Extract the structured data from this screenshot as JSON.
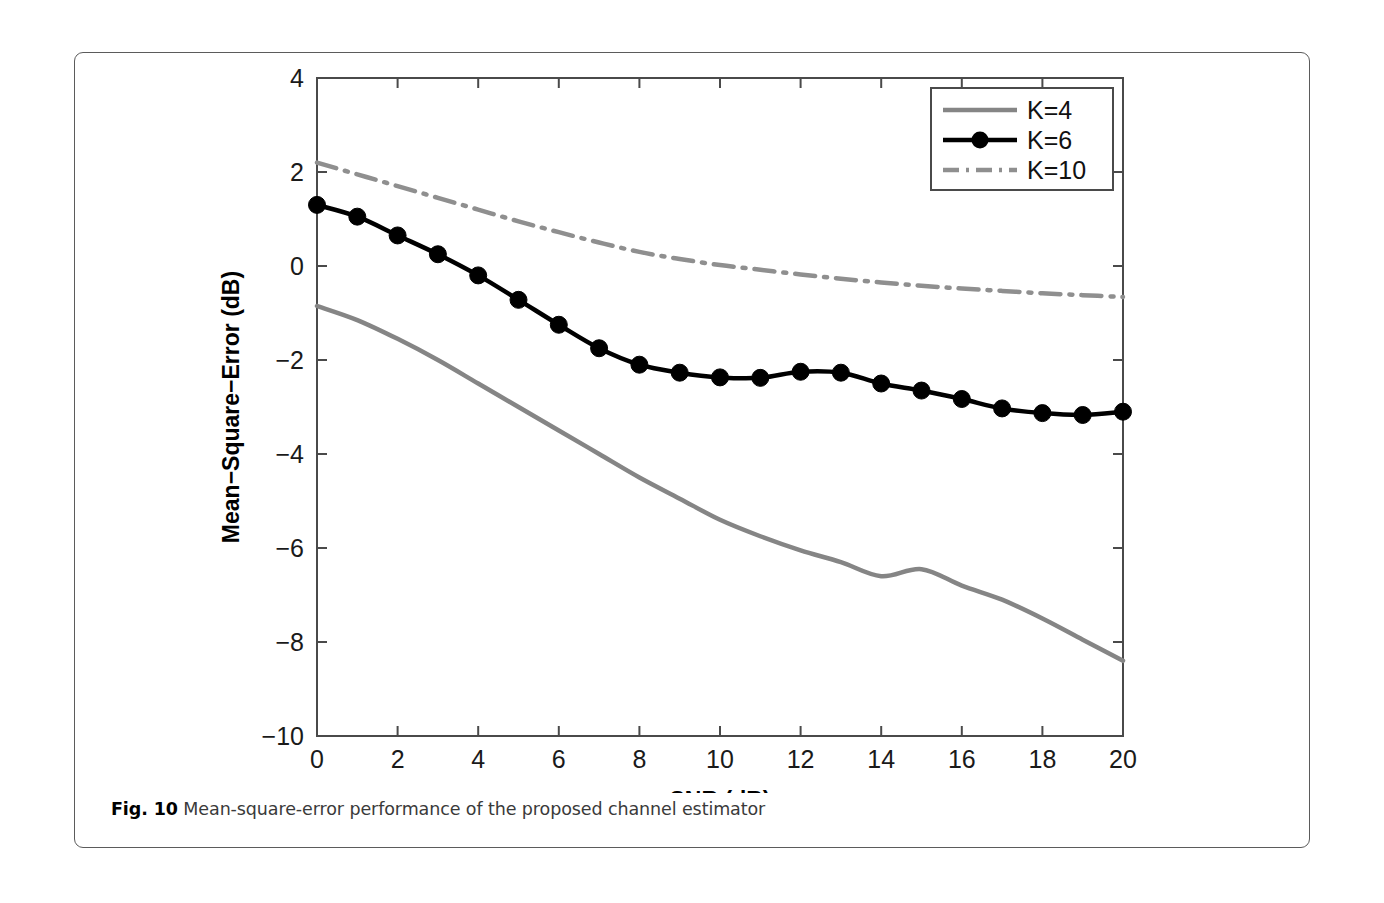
{
  "figure": {
    "caption_label": "Fig. 10",
    "caption_text": "Mean-square-error performance of the proposed channel estimator"
  },
  "chart_data": {
    "type": "line",
    "title": "",
    "xlabel": "SNR (dB)",
    "ylabel": "Mean−Square−Error (dB)",
    "xlim": [
      0,
      20
    ],
    "ylim": [
      -10,
      4
    ],
    "xticks": [
      0,
      2,
      4,
      6,
      8,
      10,
      12,
      14,
      16,
      18,
      20
    ],
    "xticklabels": [
      "0",
      "2",
      "4",
      "6",
      "8",
      "10",
      "12",
      "14",
      "16",
      "18",
      "20"
    ],
    "yticks": [
      4,
      2,
      0,
      -2,
      -4,
      -6,
      -8,
      -10
    ],
    "yticklabels": [
      "4",
      "2",
      "0",
      "−2",
      "−4",
      "−6",
      "−8",
      "−10"
    ],
    "grid": false,
    "legend_position": "upper right",
    "x": [
      0,
      1,
      2,
      3,
      4,
      5,
      6,
      7,
      8,
      9,
      10,
      11,
      12,
      13,
      14,
      15,
      16,
      17,
      18,
      19,
      20
    ],
    "series": [
      {
        "name": "K=4",
        "color": "#858585",
        "linestyle": "solid",
        "marker": "none",
        "linewidth": 4.5,
        "values": [
          -0.85,
          -1.15,
          -1.55,
          -2.0,
          -2.5,
          -3.0,
          -3.5,
          -4.0,
          -4.5,
          -4.95,
          -5.4,
          -5.75,
          -6.05,
          -6.3,
          -6.6,
          -6.45,
          -6.8,
          -7.1,
          -7.5,
          -7.95,
          -8.4
        ]
      },
      {
        "name": "K=6",
        "color": "#000000",
        "linestyle": "solid",
        "marker": "circle",
        "linewidth": 4.5,
        "values": [
          1.3,
          1.05,
          0.65,
          0.25,
          -0.2,
          -0.72,
          -1.25,
          -1.75,
          -2.1,
          -2.27,
          -2.37,
          -2.38,
          -2.25,
          -2.27,
          -2.5,
          -2.65,
          -2.83,
          -3.03,
          -3.13,
          -3.17,
          -3.1
        ]
      },
      {
        "name": "K=10",
        "color": "#8f8f8f",
        "linestyle": "dashdot",
        "marker": "none",
        "linewidth": 4.5,
        "values": [
          2.2,
          1.95,
          1.7,
          1.45,
          1.2,
          0.95,
          0.72,
          0.5,
          0.3,
          0.15,
          0.02,
          -0.08,
          -0.18,
          -0.27,
          -0.35,
          -0.42,
          -0.48,
          -0.53,
          -0.58,
          -0.62,
          -0.66
        ]
      }
    ]
  }
}
